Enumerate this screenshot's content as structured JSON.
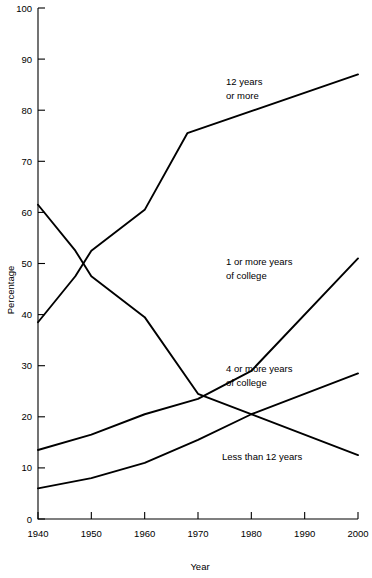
{
  "chart_data": {
    "type": "line",
    "title": "",
    "subtitle": "",
    "xlabel": "Year",
    "ylabel": "Percentage",
    "xlim": [
      1940,
      2000
    ],
    "ylim": [
      0,
      100
    ],
    "xticks": [
      1940,
      1950,
      1960,
      1970,
      1980,
      1990,
      2000
    ],
    "yticks": [
      0,
      10,
      20,
      30,
      40,
      50,
      60,
      70,
      80,
      90,
      100
    ],
    "grid": false,
    "legend": "inline-annotations",
    "series": [
      {
        "name": "12 years or more",
        "annotation": "12 years\nor more",
        "annotation_line1": "12 years",
        "annotation_line2": "or more",
        "color": "#000000",
        "x": [
          1940,
          1947,
          1950,
          1960,
          1968,
          2000
        ],
        "values": [
          38.5,
          47.5,
          52.5,
          60.5,
          75.5,
          87.0
        ]
      },
      {
        "name": "Less than 12 years",
        "annotation": "Less than 12 years",
        "annotation_line1": "Less than 12 years",
        "annotation_line2": "",
        "color": "#000000",
        "x": [
          1940,
          1947,
          1950,
          1960,
          1970,
          2000
        ],
        "values": [
          61.5,
          52.5,
          47.5,
          39.5,
          24.5,
          12.5
        ]
      },
      {
        "name": "1 or more years of college",
        "annotation": "1 or more years\nof college",
        "annotation_line1": "1 or more years",
        "annotation_line2": "of college",
        "color": "#000000",
        "x": [
          1940,
          1950,
          1960,
          1970,
          1980,
          2000
        ],
        "values": [
          13.5,
          16.5,
          20.5,
          23.5,
          29.0,
          51.0
        ]
      },
      {
        "name": "4 or more years of college",
        "annotation": "4 or more years\nof college",
        "annotation_line1": "4 or more years",
        "annotation_line2": "of college",
        "color": "#000000",
        "x": [
          1940,
          1950,
          1960,
          1970,
          1980,
          2000
        ],
        "values": [
          6.0,
          8.0,
          11.0,
          15.5,
          20.5,
          28.5
        ]
      }
    ]
  },
  "axes": {
    "y_title": "Percentage",
    "x_title": "Year",
    "y_tick_labels": [
      "0",
      "10",
      "20",
      "30",
      "40",
      "50",
      "60",
      "70",
      "80",
      "90",
      "100"
    ],
    "x_tick_labels": [
      "1940",
      "1950",
      "1960",
      "1970",
      "1980",
      "1990",
      "2000"
    ]
  },
  "annotations": {
    "a1_line1": "12 years",
    "a1_line2": "or more",
    "a2_line1": "1 or more years",
    "a2_line2": "of college",
    "a3_line1": "4 or more years",
    "a3_line2": "of college",
    "a4_line1": "Less than 12 years"
  }
}
